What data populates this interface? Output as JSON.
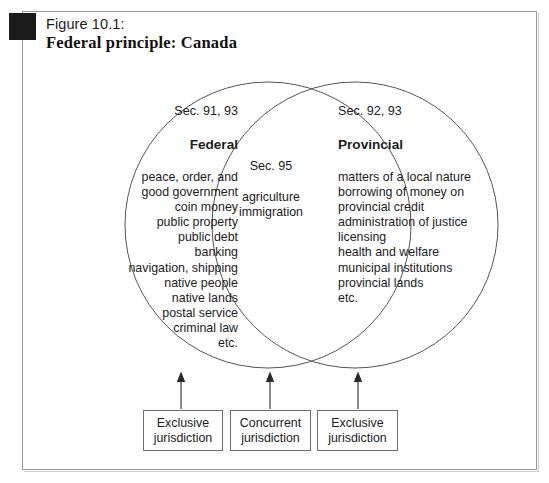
{
  "figure": {
    "number_label": "Figure 10.1:",
    "title": "Federal principle: Canada"
  },
  "venn": {
    "left": {
      "section_label": "Sec. 91, 93",
      "heading": "Federal",
      "items": "peace, order, and\ngood government\ncoin money\npublic property\npublic debt\nbanking\nnavigation, shipping\nnative people\nnative lands\npostal service\ncriminal law\netc."
    },
    "center": {
      "section_label": "Sec. 95",
      "items": "agriculture\nimmigration"
    },
    "right": {
      "section_label": "Sec. 92, 93",
      "heading": "Provincial",
      "items": "matters of a local nature\nborrowing of money on\n    provincial credit\nadministration of justice\nlicensing\nhealth and welfare\nmunicipal institutions\nprovincial lands\netc."
    }
  },
  "legend_boxes": [
    {
      "label": "Exclusive\njurisdiction"
    },
    {
      "label": "Concurrent\njurisdiction"
    },
    {
      "label": "Exclusive\njurisdiction"
    }
  ],
  "colors": {
    "frame_border": "#9a9a9a",
    "circle_stroke": "#555555",
    "box_border": "#6f6f6f",
    "text": "#1c1c1c",
    "marker": "#1a1a1a"
  }
}
